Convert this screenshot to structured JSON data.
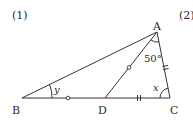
{
  "problem_labels": {
    "first": "(1)",
    "second": "(2)"
  },
  "vertices": {
    "A": {
      "label": "A",
      "x": 157,
      "y": 32
    },
    "B": {
      "label": "B",
      "x": 22,
      "y": 98
    },
    "C": {
      "label": "C",
      "x": 170,
      "y": 98
    },
    "D": {
      "label": "D",
      "x": 105,
      "y": 98
    }
  },
  "angles": {
    "DAC": "50°",
    "ACB": "x",
    "ABC": "y"
  },
  "equal_marks": {
    "circle": [
      "BD",
      "AD"
    ],
    "double_tick": [
      "DC",
      "AC"
    ]
  },
  "colors": {
    "stroke": "#333333",
    "text": "#2a2a2a"
  }
}
